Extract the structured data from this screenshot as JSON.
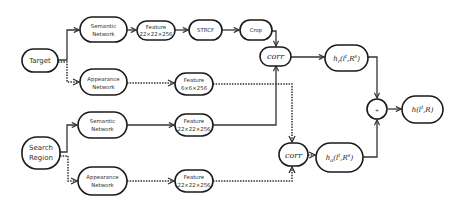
{
  "diagram": {
    "inputs": {
      "target": "Target",
      "search_region": [
        "Search",
        "Region"
      ]
    },
    "top_branch": {
      "semantic_network": [
        "Semantic",
        "Network"
      ],
      "semantic_feature": [
        "Feature",
        "22×22×256"
      ],
      "strcf": "STRCF",
      "crop": "Crop",
      "appearance_network": [
        "Appearance",
        "Network"
      ],
      "appearance_feature": [
        "Feature",
        "6×6×256"
      ]
    },
    "bottom_branch": {
      "semantic_network": [
        "Semantic",
        "Network"
      ],
      "semantic_feature": [
        "Feature",
        "22×22×256"
      ],
      "appearance_network": [
        "Appearance",
        "Network"
      ],
      "appearance_feature": [
        "Feature",
        "22×22×256"
      ]
    },
    "fusion": {
      "corr_top": "corr",
      "corr_bottom": "corr",
      "h_semantic": "h",
      "h_semantic_sub": "r",
      "h_semantic_args": "(l",
      "h_semantic_sup": "t",
      "h_semantic_rest": ",R",
      "h_semantic_sup2": "s",
      "h_appearance": "h",
      "h_appearance_sub": "a",
      "h_appearance_args": "(l",
      "h_appearance_sup": "t",
      "h_appearance_rest": ",R",
      "h_appearance_sup2": "s",
      "plus": "+",
      "output": "h",
      "output_args": "(l",
      "output_sup": "t",
      "output_rest": ",R)"
    },
    "edge_styles": {
      "semantic": "solid",
      "appearance": "dotted"
    }
  }
}
